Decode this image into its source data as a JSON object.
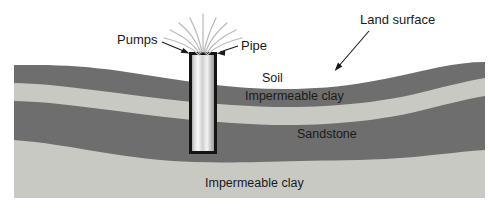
{
  "diagram": {
    "background_color": "#ffffff",
    "callouts": [
      {
        "id": "pumps",
        "label": "Pumps",
        "icon": "arrow-right-icon"
      },
      {
        "id": "pipe",
        "label": "Pipe",
        "icon": "arrow-left-icon"
      },
      {
        "id": "land_surface",
        "label": "Land surface",
        "icon": "arrow-down-left-icon"
      }
    ],
    "layers": [
      {
        "id": "soil",
        "label": "Soil",
        "color": "#6e6e6e"
      },
      {
        "id": "upper_clay",
        "label": "Impermeable clay",
        "color": "#c9c9c4"
      },
      {
        "id": "sandstone",
        "label": "Sandstone",
        "color": "#6e6e6e"
      },
      {
        "id": "lower_clay",
        "label": "Impermeable clay",
        "color": "#c9c9c4"
      }
    ],
    "structures": [
      {
        "id": "well_pipe",
        "name": "Pipe",
        "outline_color": "#141414",
        "fill_light": "#f2f2f2",
        "fill_dark": "#8c8c8c"
      },
      {
        "id": "water_spray",
        "name": "Water spray",
        "color": "#b9b9b9",
        "stream_count": 9
      }
    ]
  }
}
